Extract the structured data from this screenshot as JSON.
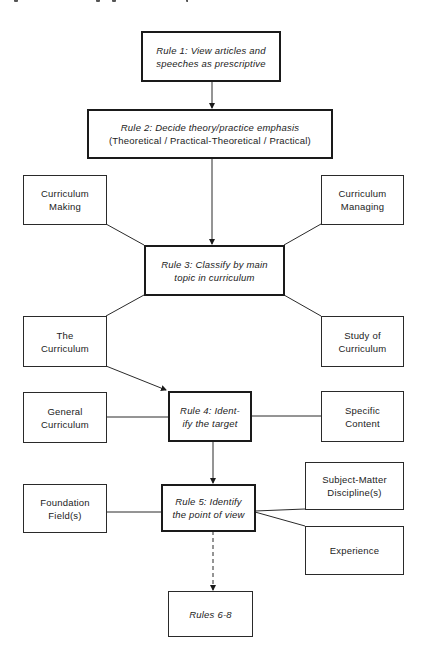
{
  "diagram": {
    "type": "flowchart",
    "rules": {
      "rule1": {
        "line1": "Rule 1: View articles and",
        "line2": "speeches as prescriptive"
      },
      "rule2": {
        "line1": "Rule 2: Decide theory/practice emphasis",
        "line2": "(Theoretical / Practical-Theoretical / Practical)"
      },
      "rule3": {
        "line1": "Rule 3: Classify by main",
        "line2": "topic in curriculum"
      },
      "rule4": {
        "line1": "Rule 4: Ident-",
        "line2": "ify the target"
      },
      "rule5": {
        "line1": "Rule 5: Identify",
        "line2": "the point of view"
      },
      "rules6_8": {
        "label": "Rules 6-8"
      }
    },
    "categories": {
      "curriculum_making": {
        "line1": "Curriculum",
        "line2": "Making"
      },
      "curriculum_managing": {
        "line1": "Curriculum",
        "line2": "Managing"
      },
      "the_curriculum": {
        "line1": "The",
        "line2": "Curriculum"
      },
      "study_of_curriculum": {
        "line1": "Study of",
        "line2": "Curriculum"
      },
      "general_curriculum": {
        "line1": "General",
        "line2": "Curriculum"
      },
      "specific_content": {
        "line1": "Specific",
        "line2": "Content"
      },
      "foundation_fields": {
        "line1": "Foundation",
        "line2": "Field(s)"
      },
      "subject_matter": {
        "line1": "Subject-Matter",
        "line2": "Discipline(s)"
      },
      "experience": {
        "label": "Experience"
      }
    },
    "colors": {
      "line": "#2a2a2a",
      "background": "#ffffff",
      "text": "#222222"
    }
  }
}
